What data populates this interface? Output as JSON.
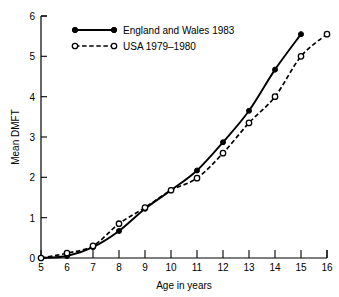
{
  "chart_data": {
    "type": "line",
    "title": "",
    "subtitle": "",
    "xlabel": "Age in years",
    "ylabel": "Mean DMFT",
    "xlim": [
      5,
      16
    ],
    "ylim": [
      0,
      6
    ],
    "xticks": [
      "5",
      "6",
      "7",
      "8",
      "9",
      "10",
      "11",
      "12",
      "13",
      "14",
      "15",
      "16"
    ],
    "yticks": [
      "0",
      "1",
      "2",
      "3",
      "4",
      "5",
      "6"
    ],
    "grid": false,
    "legend_position": "top-left-inside",
    "series": [
      {
        "name": "England and Wales 1983",
        "marker": "filled-circle",
        "linestyle": "solid",
        "color": "#000000",
        "x": [
          5,
          6,
          7,
          8,
          9,
          10,
          11,
          12,
          13,
          14,
          15
        ],
        "values": [
          0.0,
          0.05,
          0.27,
          0.67,
          1.22,
          1.68,
          2.17,
          2.87,
          3.65,
          4.67,
          5.55
        ]
      },
      {
        "name": "USA 1979–1980",
        "marker": "open-circle",
        "linestyle": "dashed",
        "color": "#000000",
        "x": [
          5,
          6,
          7,
          8,
          9,
          10,
          11,
          12,
          13,
          14,
          15,
          16
        ],
        "values": [
          0.0,
          0.12,
          0.3,
          0.85,
          1.25,
          1.68,
          1.98,
          2.6,
          3.35,
          4.0,
          5.0,
          5.55
        ]
      }
    ]
  },
  "legend": {
    "entries": [
      {
        "label": "England and Wales 1983"
      },
      {
        "label": "USA 1979–1980"
      }
    ]
  },
  "axes": {
    "x_title": "Age in years",
    "y_title": "Mean DMFT"
  }
}
